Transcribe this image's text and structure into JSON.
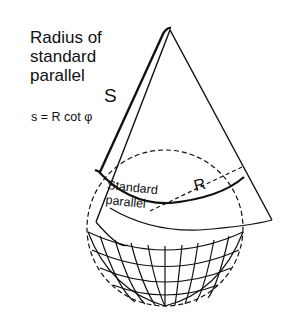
{
  "diagram": {
    "title_lines": [
      "Radius of",
      "standard",
      "parallel"
    ],
    "formula": "s = R cot φ",
    "labels": {
      "slant": "S",
      "standard_parallel_line1": "Standard",
      "standard_parallel_line2": "parallel",
      "radius": "R"
    },
    "colors": {
      "line": "#111111",
      "background": "#ffffff"
    }
  }
}
